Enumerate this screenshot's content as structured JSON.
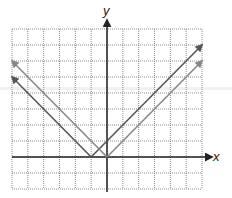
{
  "chart_data": {
    "type": "line",
    "title": "",
    "xlabel": "x",
    "ylabel": "y",
    "xlim": [
      -6,
      6
    ],
    "ylim": [
      -2,
      8
    ],
    "grid": true,
    "grid_style": "dotted",
    "tick_labels": false,
    "legend": null,
    "series": [
      {
        "name": "y = |x + 1|",
        "color": "#555555",
        "vertex": [
          -1,
          0
        ],
        "points": [
          [
            -6,
            5
          ],
          [
            -1,
            0
          ],
          [
            6,
            7
          ]
        ]
      },
      {
        "name": "y = |x|",
        "color": "#888888",
        "vertex": [
          0,
          0
        ],
        "points": [
          [
            -6,
            6
          ],
          [
            0,
            0
          ],
          [
            6,
            6
          ]
        ]
      }
    ]
  },
  "labels": {
    "x_axis": "x",
    "y_axis": "y"
  }
}
